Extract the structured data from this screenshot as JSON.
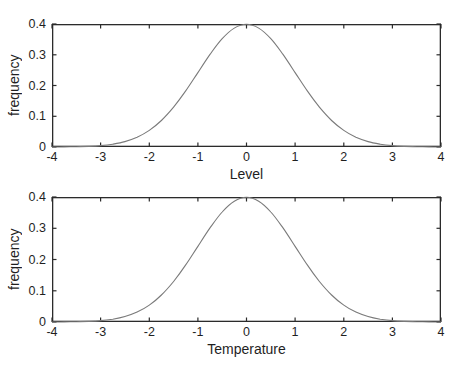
{
  "colors": {
    "background": "#ffffff",
    "axis": "#2b2b2b",
    "curve": "#7a7a7a",
    "text": "#1f1f1f"
  },
  "chart_data": [
    {
      "type": "line",
      "xlabel": "Level",
      "ylabel": "frequency",
      "xlim": [
        -4,
        4
      ],
      "ylim": [
        0,
        0.4
      ],
      "xticks": [
        -4,
        -3,
        -2,
        -1,
        0,
        1,
        2,
        3,
        4
      ],
      "xtick_labels": [
        "-4",
        "-3",
        "-2",
        "-1",
        "0",
        "1",
        "2",
        "3",
        "4"
      ],
      "yticks": [
        0,
        0.1,
        0.2,
        0.3,
        0.4
      ],
      "ytick_labels": [
        "0",
        "0.1",
        "0.2",
        "0.3",
        "0.4"
      ],
      "grid": false,
      "box": true,
      "series": [
        {
          "name": "standard-normal-pdf",
          "x": [
            -4,
            -3.75,
            -3.5,
            -3.25,
            -3,
            -2.75,
            -2.5,
            -2.25,
            -2,
            -1.75,
            -1.5,
            -1.25,
            -1,
            -0.75,
            -0.5,
            -0.25,
            0,
            0.25,
            0.5,
            0.75,
            1,
            1.25,
            1.5,
            1.75,
            2,
            2.25,
            2.5,
            2.75,
            3,
            3.25,
            3.5,
            3.75,
            4
          ],
          "y": [
            0.0001,
            0.0004,
            0.0009,
            0.002,
            0.0044,
            0.0091,
            0.0175,
            0.0317,
            0.054,
            0.0863,
            0.1295,
            0.1826,
            0.242,
            0.3011,
            0.3521,
            0.3867,
            0.3989,
            0.3867,
            0.3521,
            0.3011,
            0.242,
            0.1826,
            0.1295,
            0.0863,
            0.054,
            0.0317,
            0.0175,
            0.0091,
            0.0044,
            0.002,
            0.0009,
            0.0004,
            0.0001
          ]
        }
      ]
    },
    {
      "type": "line",
      "xlabel": "Temperature",
      "ylabel": "frequency",
      "xlim": [
        -4,
        4
      ],
      "ylim": [
        0,
        0.4
      ],
      "xticks": [
        -4,
        -3,
        -2,
        -1,
        0,
        1,
        2,
        3,
        4
      ],
      "xtick_labels": [
        "-4",
        "-3",
        "-2",
        "-1",
        "0",
        "1",
        "2",
        "3",
        "4"
      ],
      "yticks": [
        0,
        0.1,
        0.2,
        0.3,
        0.4
      ],
      "ytick_labels": [
        "0",
        "0.1",
        "0.2",
        "0.3",
        "0.4"
      ],
      "grid": false,
      "box": true,
      "series": [
        {
          "name": "standard-normal-pdf",
          "x": [
            -4,
            -3.75,
            -3.5,
            -3.25,
            -3,
            -2.75,
            -2.5,
            -2.25,
            -2,
            -1.75,
            -1.5,
            -1.25,
            -1,
            -0.75,
            -0.5,
            -0.25,
            0,
            0.25,
            0.5,
            0.75,
            1,
            1.25,
            1.5,
            1.75,
            2,
            2.25,
            2.5,
            2.75,
            3,
            3.25,
            3.5,
            3.75,
            4
          ],
          "y": [
            0.0001,
            0.0004,
            0.0009,
            0.002,
            0.0044,
            0.0091,
            0.0175,
            0.0317,
            0.054,
            0.0863,
            0.1295,
            0.1826,
            0.242,
            0.3011,
            0.3521,
            0.3867,
            0.3989,
            0.3867,
            0.3521,
            0.3011,
            0.242,
            0.1826,
            0.1295,
            0.0863,
            0.054,
            0.0317,
            0.0175,
            0.0091,
            0.0044,
            0.002,
            0.0009,
            0.0004,
            0.0001
          ]
        }
      ]
    }
  ]
}
